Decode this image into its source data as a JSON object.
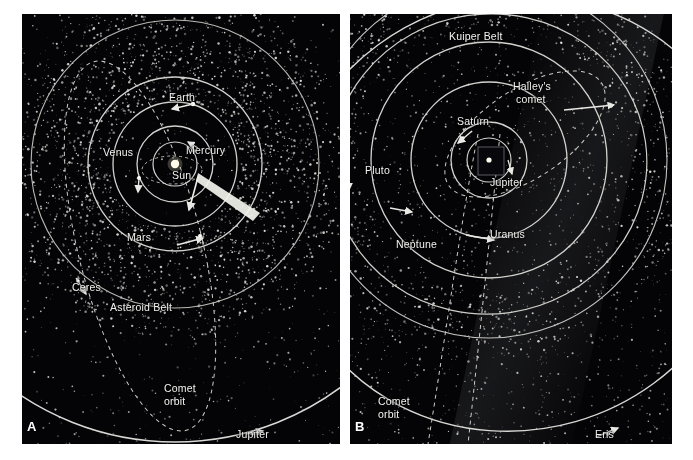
{
  "figure": {
    "type": "astronomy-diagram",
    "background_color": "#040406",
    "orbit_color": "#d8d8d4",
    "label_color": "#f2f2f0",
    "panel_count": 2
  },
  "panels": [
    {
      "id": "A",
      "letter": "A",
      "caption": "Inner Solar System",
      "center_label": "Sun",
      "labels": [
        {
          "name": "sun",
          "text": "Sun",
          "x": 172,
          "y": 176
        },
        {
          "name": "mercury",
          "text": "Mercury",
          "x": 186,
          "y": 150
        },
        {
          "name": "venus",
          "text": "Venus",
          "x": 103,
          "y": 152
        },
        {
          "name": "earth",
          "text": "Earth",
          "x": 169,
          "y": 97
        },
        {
          "name": "mars",
          "text": "Mars",
          "x": 127,
          "y": 237
        },
        {
          "name": "ceres",
          "text": "Ceres",
          "x": 72,
          "y": 287
        },
        {
          "name": "asteroid-belt",
          "text": "Asteroid Belt",
          "x": 110,
          "y": 307
        },
        {
          "name": "comet-orbit",
          "text": "Comet",
          "x": 164,
          "y": 388
        },
        {
          "name": "comet-orbit-2",
          "text": "orbit",
          "x": 164,
          "y": 401
        },
        {
          "name": "jupiter",
          "text": "Jupiter",
          "x": 236,
          "y": 434
        }
      ],
      "orbits": [
        {
          "name": "mercury-orbit",
          "r": 22
        },
        {
          "name": "venus-orbit",
          "r": 38
        },
        {
          "name": "earth-orbit",
          "r": 62
        },
        {
          "name": "mars-orbit",
          "r": 87
        },
        {
          "name": "asteroid-belt-ring",
          "r": 144
        },
        {
          "name": "jupiter-orbit",
          "r": 278
        }
      ]
    },
    {
      "id": "B",
      "letter": "B",
      "caption": "Outer Solar System",
      "center_label": "",
      "labels": [
        {
          "name": "kuiper-belt",
          "text": "Kuiper Belt",
          "x": 449,
          "y": 36
        },
        {
          "name": "halleys-comet",
          "text": "Halley's",
          "x": 513,
          "y": 86
        },
        {
          "name": "halleys-comet-2",
          "text": "comet",
          "x": 516,
          "y": 99
        },
        {
          "name": "saturn",
          "text": "Saturn",
          "x": 457,
          "y": 121
        },
        {
          "name": "jupiter",
          "text": "Jupiter",
          "x": 490,
          "y": 182
        },
        {
          "name": "pluto",
          "text": "Pluto",
          "x": 365,
          "y": 170
        },
        {
          "name": "neptune",
          "text": "Neptune",
          "x": 396,
          "y": 244
        },
        {
          "name": "uranus",
          "text": "Uranus",
          "x": 490,
          "y": 234
        },
        {
          "name": "comet-orbit",
          "text": "Comet",
          "x": 378,
          "y": 401
        },
        {
          "name": "comet-orbit-2",
          "text": "orbit",
          "x": 378,
          "y": 414
        },
        {
          "name": "eris",
          "text": "Eris",
          "x": 595,
          "y": 434
        }
      ],
      "orbits": [
        {
          "name": "jupiter-orbit",
          "r": 22
        },
        {
          "name": "saturn-orbit",
          "r": 38
        },
        {
          "name": "uranus-orbit",
          "r": 78
        },
        {
          "name": "neptune-orbit",
          "r": 118
        },
        {
          "name": "pluto-orbit",
          "r": 152
        },
        {
          "name": "kuiper-belt-ring",
          "r": 178
        },
        {
          "name": "eris-orbit",
          "r": 246
        }
      ]
    }
  ],
  "chart_data": {
    "type": "scatter",
    "xlabel": "",
    "ylabel": "",
    "panels": [
      {
        "label": "A",
        "name": "Inner Solar System",
        "bodies": [
          "Sun",
          "Mercury",
          "Venus",
          "Earth",
          "Mars",
          "Ceres",
          "Jupiter"
        ],
        "features": [
          "Asteroid Belt",
          "Comet orbit"
        ],
        "orbit_radii_px": [
          22,
          38,
          62,
          87,
          144,
          278
        ]
      },
      {
        "label": "B",
        "name": "Outer Solar System",
        "bodies": [
          "Jupiter",
          "Saturn",
          "Uranus",
          "Neptune",
          "Pluto",
          "Eris"
        ],
        "features": [
          "Kuiper Belt",
          "Halley's comet",
          "Comet orbit"
        ],
        "orbit_radii_px": [
          22,
          38,
          78,
          118,
          152,
          178,
          246
        ]
      }
    ]
  }
}
